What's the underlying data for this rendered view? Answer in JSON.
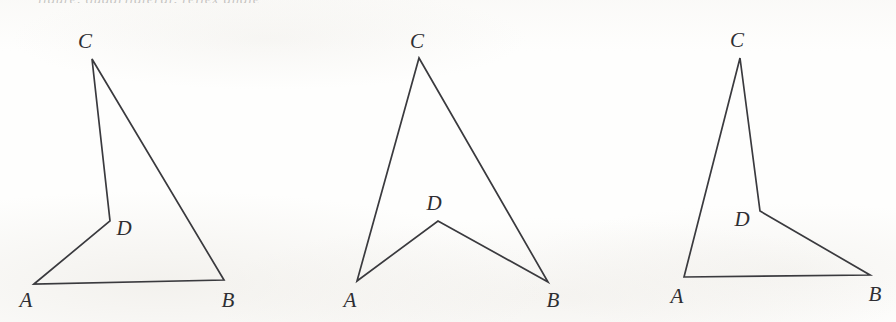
{
  "plate": {
    "width": 896,
    "height": 322,
    "background_color": "#fefefd",
    "stroke_color": "#3a3a3e",
    "label_color": "#2e2e32",
    "top_sliver_text": "figure, quadrilateral,  reflex  angle"
  },
  "chart_data": {
    "type": "diagram",
    "title": "",
    "figures": [
      {
        "id": "figure-1",
        "name": "convex-quadrilateral-ADCB",
        "path_order": [
          "A",
          "D",
          "C",
          "B"
        ],
        "closed": true,
        "points": {
          "A": {
            "x": 34,
            "y": 284
          },
          "B": {
            "x": 224,
            "y": 280
          },
          "C": {
            "x": 92,
            "y": 59
          },
          "D": {
            "x": 110,
            "y": 221
          }
        },
        "polygon_points": "34,284 110,221 92,59 224,280",
        "labels": [
          {
            "text": "C",
            "x": 85,
            "y": 41
          },
          {
            "text": "D",
            "x": 124,
            "y": 228
          },
          {
            "text": "A",
            "x": 26,
            "y": 300
          },
          {
            "text": "B",
            "x": 228,
            "y": 300
          }
        ]
      },
      {
        "id": "figure-2",
        "name": "concave-dart-quadrilateral-ADBC",
        "path_order": [
          "A",
          "D",
          "B",
          "C"
        ],
        "closed": true,
        "points": {
          "A": {
            "x": 357,
            "y": 281
          },
          "B": {
            "x": 548,
            "y": 282
          },
          "C": {
            "x": 419,
            "y": 58
          },
          "D": {
            "x": 438,
            "y": 221
          }
        },
        "polygon_points": "357,281 438,221 548,282 419,58",
        "labels": [
          {
            "text": "C",
            "x": 417,
            "y": 41
          },
          {
            "text": "D",
            "x": 434,
            "y": 203
          },
          {
            "text": "A",
            "x": 350,
            "y": 300
          },
          {
            "text": "B",
            "x": 553,
            "y": 300
          }
        ]
      },
      {
        "id": "figure-3",
        "name": "quadrilateral-ACDB",
        "path_order": [
          "A",
          "C",
          "D",
          "B"
        ],
        "closed": true,
        "points": {
          "A": {
            "x": 684,
            "y": 277
          },
          "B": {
            "x": 870,
            "y": 275
          },
          "C": {
            "x": 740,
            "y": 58
          },
          "D": {
            "x": 760,
            "y": 211
          }
        },
        "polygon_points": "684,277 740,58 760,211 870,275",
        "labels": [
          {
            "text": "C",
            "x": 737,
            "y": 40
          },
          {
            "text": "D",
            "x": 742,
            "y": 219
          },
          {
            "text": "A",
            "x": 677,
            "y": 296
          },
          {
            "text": "B",
            "x": 875,
            "y": 294
          }
        ]
      }
    ]
  }
}
